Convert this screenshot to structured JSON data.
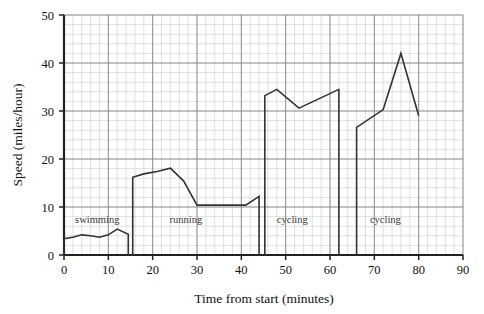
{
  "chart_data": {
    "type": "line",
    "title": "",
    "xlabel": "Time from start (minutes)",
    "ylabel": "Speed (miles/hour)",
    "xlim": [
      0,
      90
    ],
    "ylim": [
      0,
      50
    ],
    "xticks": [
      0,
      10,
      20,
      30,
      40,
      50,
      60,
      70,
      80,
      90
    ],
    "yticks": [
      0,
      10,
      20,
      30,
      40,
      50
    ],
    "xtick_labels": [
      "0",
      "10",
      "20",
      "30",
      "40",
      "50",
      "60",
      "70",
      "80",
      "90"
    ],
    "ytick_labels": [
      "0",
      "10",
      "20",
      "30",
      "40",
      "50"
    ],
    "grid": true,
    "grid_major_x": 10,
    "grid_major_y": 10,
    "grid_minor_x": 2,
    "grid_minor_y": 2,
    "legend": "none",
    "line_color": "#333333",
    "grid_major_color": "#888888",
    "grid_minor_color": "#cccccc",
    "axis_color": "#222222",
    "series": [
      {
        "name": "swimming",
        "annotation": "swimming",
        "annotation_x": 7.5,
        "annotation_y": 6.6,
        "points": [
          [
            0,
            0
          ],
          [
            0,
            3.4
          ],
          [
            2,
            3.7
          ],
          [
            4,
            4.2
          ],
          [
            6,
            4.0
          ],
          [
            8,
            3.7
          ],
          [
            10,
            4.2
          ],
          [
            12,
            5.4
          ],
          [
            14.5,
            4.3
          ],
          [
            14.5,
            0
          ]
        ]
      },
      {
        "name": "running",
        "annotation": "running",
        "annotation_x": 27.5,
        "annotation_y": 6.6,
        "points": [
          [
            15.5,
            0
          ],
          [
            15.5,
            16.2
          ],
          [
            18,
            16.9
          ],
          [
            21,
            17.4
          ],
          [
            24,
            18.1
          ],
          [
            27,
            15.4
          ],
          [
            30,
            10.4
          ],
          [
            36,
            10.4
          ],
          [
            41,
            10.4
          ],
          [
            44,
            12.2
          ],
          [
            44,
            0
          ]
        ]
      },
      {
        "name": "cycling-1",
        "annotation": "cycling",
        "annotation_x": 51.5,
        "annotation_y": 6.6,
        "points": [
          [
            45.3,
            0
          ],
          [
            45.3,
            33.2
          ],
          [
            48,
            34.5
          ],
          [
            53,
            30.6
          ],
          [
            62,
            34.5
          ],
          [
            62,
            0
          ]
        ]
      },
      {
        "name": "cycling-2",
        "annotation": "cycling",
        "annotation_x": 72.5,
        "annotation_y": 6.6,
        "points": [
          [
            66,
            0
          ],
          [
            66,
            26.6
          ],
          [
            72,
            30.3
          ],
          [
            76,
            42.0
          ],
          [
            80,
            29.0
          ]
        ]
      }
    ]
  }
}
